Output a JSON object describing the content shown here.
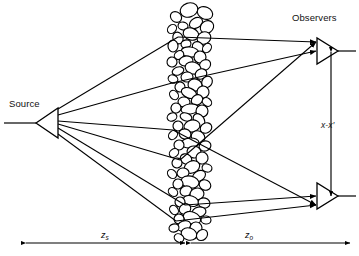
{
  "figure": {
    "type": "optical-scattering-geometry-diagram",
    "background_color": "#ffffff",
    "stroke_color": "#000000"
  },
  "labels": {
    "source": "Source",
    "observers": "Observers",
    "separation": "x-x",
    "separation_prime": "′",
    "distance_source": "z",
    "distance_source_sub": "s",
    "distance_observer": "z",
    "distance_observer_sub": "o"
  },
  "geometry": {
    "source": {
      "apex_x": 36,
      "base_x": 58,
      "y": 123,
      "half_height": 15,
      "tail_x": 4
    },
    "observers": [
      {
        "name": "observer-top",
        "apex_x": 338,
        "base_x": 317,
        "y": 51,
        "half_height": 13,
        "tail_x": 356
      },
      {
        "name": "observer-bottom",
        "apex_x": 338,
        "base_x": 317,
        "y": 196,
        "half_height": 13,
        "tail_x": 356
      }
    ],
    "medium": {
      "center_x": 188,
      "left_x": 167,
      "right_x": 212,
      "top_y": 4,
      "bottom_y": 241,
      "blob_count": 96
    },
    "separation_arrow": {
      "x": 331,
      "y_top": 52,
      "y_bottom": 196
    },
    "dimension_axis_y": 243,
    "z_s_arrow": {
      "x_start": 26,
      "x_end": 185
    },
    "z_o_arrow": {
      "x_start": 191,
      "x_end": 350
    }
  },
  "rays": {
    "count": 6,
    "source_fan_y": [
      109,
      115,
      121,
      124,
      128,
      134
    ],
    "scatter_points": [
      {
        "x": 178,
        "y": 37,
        "to": "observer-top"
      },
      {
        "x": 172,
        "y": 83,
        "to": "observer-top"
      },
      {
        "x": 173,
        "y": 130,
        "to": "observer-bottom"
      },
      {
        "x": 180,
        "y": 160,
        "to": "observer-top"
      },
      {
        "x": 185,
        "y": 205,
        "to": "observer-bottom"
      },
      {
        "x": 176,
        "y": 221,
        "to": "observer-bottom"
      }
    ]
  },
  "blobs": [
    {
      "cx": 189,
      "cy": 10,
      "rx": 9,
      "ry": 7,
      "rot": -18
    },
    {
      "cx": 205,
      "cy": 13,
      "rx": 8,
      "ry": 6,
      "rot": 25
    },
    {
      "cx": 176,
      "cy": 17,
      "rx": 6,
      "ry": 5,
      "rot": 40
    },
    {
      "cx": 196,
      "cy": 23,
      "rx": 7,
      "ry": 5,
      "rot": -30
    },
    {
      "cx": 183,
      "cy": 26,
      "rx": 5,
      "ry": 4,
      "rot": 10
    },
    {
      "cx": 207,
      "cy": 27,
      "rx": 6,
      "ry": 7,
      "rot": 55
    },
    {
      "cx": 172,
      "cy": 29,
      "rx": 5,
      "ry": 4,
      "rot": -45
    },
    {
      "cx": 191,
      "cy": 34,
      "rx": 8,
      "ry": 6,
      "rot": 20
    },
    {
      "cx": 204,
      "cy": 38,
      "rx": 7,
      "ry": 6,
      "rot": -25
    },
    {
      "cx": 178,
      "cy": 38,
      "rx": 6,
      "ry": 5,
      "rot": 65
    },
    {
      "cx": 186,
      "cy": 44,
      "rx": 5,
      "ry": 4,
      "rot": -15
    },
    {
      "cx": 198,
      "cy": 47,
      "rx": 6,
      "ry": 5,
      "rot": 35
    },
    {
      "cx": 173,
      "cy": 46,
      "rx": 5,
      "ry": 6,
      "rot": 0
    },
    {
      "cx": 207,
      "cy": 48,
      "rx": 5,
      "ry": 4,
      "rot": -50
    },
    {
      "cx": 190,
      "cy": 52,
      "rx": 9,
      "ry": 5,
      "rot": 8
    },
    {
      "cx": 179,
      "cy": 55,
      "rx": 5,
      "ry": 4,
      "rot": -35
    },
    {
      "cx": 200,
      "cy": 57,
      "rx": 6,
      "ry": 6,
      "rot": 45
    },
    {
      "cx": 186,
      "cy": 61,
      "rx": 7,
      "ry": 5,
      "rot": -10
    },
    {
      "cx": 172,
      "cy": 62,
      "rx": 5,
      "ry": 5,
      "rot": 30
    },
    {
      "cx": 205,
      "cy": 65,
      "rx": 6,
      "ry": 5,
      "rot": -40
    },
    {
      "cx": 193,
      "cy": 68,
      "rx": 8,
      "ry": 6,
      "rot": 15
    },
    {
      "cx": 178,
      "cy": 71,
      "rx": 6,
      "ry": 4,
      "rot": -20
    },
    {
      "cx": 201,
      "cy": 74,
      "rx": 5,
      "ry": 6,
      "rot": 60
    },
    {
      "cx": 187,
      "cy": 77,
      "rx": 6,
      "ry": 5,
      "rot": -5
    },
    {
      "cx": 173,
      "cy": 79,
      "rx": 5,
      "ry": 4,
      "rot": 25
    },
    {
      "cx": 207,
      "cy": 82,
      "rx": 6,
      "ry": 5,
      "rot": -55
    },
    {
      "cx": 195,
      "cy": 85,
      "rx": 7,
      "ry": 6,
      "rot": 12
    },
    {
      "cx": 180,
      "cy": 87,
      "rx": 5,
      "ry": 5,
      "rot": -30
    },
    {
      "cx": 189,
      "cy": 93,
      "rx": 8,
      "ry": 5,
      "rot": 22
    },
    {
      "cx": 203,
      "cy": 92,
      "rx": 6,
      "ry": 6,
      "rot": -15
    },
    {
      "cx": 174,
      "cy": 95,
      "rx": 5,
      "ry": 4,
      "rot": 50
    },
    {
      "cx": 197,
      "cy": 100,
      "rx": 6,
      "ry": 5,
      "rot": -35
    },
    {
      "cx": 184,
      "cy": 102,
      "rx": 6,
      "ry": 5,
      "rot": 5
    },
    {
      "cx": 207,
      "cy": 102,
      "rx": 5,
      "ry": 4,
      "rot": 40
    },
    {
      "cx": 190,
      "cy": 109,
      "rx": 9,
      "ry": 5,
      "rot": -8
    },
    {
      "cx": 176,
      "cy": 108,
      "rx": 5,
      "ry": 5,
      "rot": 28
    },
    {
      "cx": 202,
      "cy": 111,
      "rx": 6,
      "ry": 6,
      "rot": -45
    },
    {
      "cx": 186,
      "cy": 117,
      "rx": 6,
      "ry": 4,
      "rot": 18
    },
    {
      "cx": 172,
      "cy": 117,
      "rx": 5,
      "ry": 4,
      "rot": -25
    },
    {
      "cx": 199,
      "cy": 120,
      "rx": 7,
      "ry": 5,
      "rot": 52
    },
    {
      "cx": 192,
      "cy": 126,
      "rx": 8,
      "ry": 6,
      "rot": -12
    },
    {
      "cx": 178,
      "cy": 126,
      "rx": 5,
      "ry": 5,
      "rot": 35
    },
    {
      "cx": 206,
      "cy": 128,
      "rx": 6,
      "ry": 5,
      "rot": -30
    },
    {
      "cx": 185,
      "cy": 134,
      "rx": 6,
      "ry": 5,
      "rot": 15
    },
    {
      "cx": 173,
      "cy": 135,
      "rx": 5,
      "ry": 4,
      "rot": -48
    },
    {
      "cx": 198,
      "cy": 137,
      "rx": 7,
      "ry": 6,
      "rot": 25
    },
    {
      "cx": 190,
      "cy": 143,
      "rx": 9,
      "ry": 5,
      "rot": -5
    },
    {
      "cx": 179,
      "cy": 145,
      "rx": 5,
      "ry": 5,
      "rot": 42
    },
    {
      "cx": 205,
      "cy": 146,
      "rx": 6,
      "ry": 5,
      "rot": -20
    },
    {
      "cx": 194,
      "cy": 152,
      "rx": 7,
      "ry": 6,
      "rot": 10
    },
    {
      "cx": 174,
      "cy": 153,
      "rx": 5,
      "ry": 4,
      "rot": -38
    },
    {
      "cx": 186,
      "cy": 159,
      "rx": 6,
      "ry": 5,
      "rot": 30
    },
    {
      "cx": 202,
      "cy": 158,
      "rx": 6,
      "ry": 6,
      "rot": -15
    },
    {
      "cx": 177,
      "cy": 163,
      "rx": 5,
      "ry": 5,
      "rot": 55
    },
    {
      "cx": 192,
      "cy": 167,
      "rx": 8,
      "ry": 6,
      "rot": -22
    },
    {
      "cx": 207,
      "cy": 168,
      "rx": 5,
      "ry": 4,
      "rot": 18
    },
    {
      "cx": 183,
      "cy": 173,
      "rx": 6,
      "ry": 5,
      "rot": -8
    },
    {
      "cx": 172,
      "cy": 174,
      "rx": 5,
      "ry": 4,
      "rot": 45
    },
    {
      "cx": 199,
      "cy": 176,
      "rx": 7,
      "ry": 5,
      "rot": -32
    },
    {
      "cx": 190,
      "cy": 182,
      "rx": 9,
      "ry": 6,
      "rot": 12
    },
    {
      "cx": 178,
      "cy": 184,
      "rx": 5,
      "ry": 5,
      "rot": -50
    },
    {
      "cx": 205,
      "cy": 185,
      "rx": 6,
      "ry": 5,
      "rot": 28
    },
    {
      "cx": 186,
      "cy": 191,
      "rx": 6,
      "ry": 5,
      "rot": -18
    },
    {
      "cx": 173,
      "cy": 192,
      "rx": 5,
      "ry": 4,
      "rot": 38
    },
    {
      "cx": 197,
      "cy": 194,
      "rx": 7,
      "ry": 6,
      "rot": -10
    },
    {
      "cx": 191,
      "cy": 201,
      "rx": 8,
      "ry": 5,
      "rot": 20
    },
    {
      "cx": 180,
      "cy": 202,
      "rx": 5,
      "ry": 5,
      "rot": -40
    },
    {
      "cx": 204,
      "cy": 203,
      "rx": 6,
      "ry": 5,
      "rot": 15
    },
    {
      "cx": 185,
      "cy": 209,
      "rx": 6,
      "ry": 5,
      "rot": -28
    },
    {
      "cx": 174,
      "cy": 210,
      "rx": 5,
      "ry": 4,
      "rot": 52
    },
    {
      "cx": 199,
      "cy": 212,
      "rx": 7,
      "ry": 5,
      "rot": -12
    },
    {
      "cx": 192,
      "cy": 218,
      "rx": 9,
      "ry": 6,
      "rot": 22
    },
    {
      "cx": 179,
      "cy": 219,
      "rx": 5,
      "ry": 5,
      "rot": -35
    },
    {
      "cx": 206,
      "cy": 220,
      "rx": 5,
      "ry": 4,
      "rot": 8
    },
    {
      "cx": 184,
      "cy": 226,
      "rx": 7,
      "ry": 5,
      "rot": -20
    },
    {
      "cx": 196,
      "cy": 228,
      "rx": 6,
      "ry": 6,
      "rot": 40
    },
    {
      "cx": 174,
      "cy": 228,
      "rx": 5,
      "ry": 4,
      "rot": -15
    },
    {
      "cx": 189,
      "cy": 234,
      "rx": 8,
      "ry": 6,
      "rot": 18
    },
    {
      "cx": 202,
      "cy": 235,
      "rx": 6,
      "ry": 5,
      "rot": -42
    },
    {
      "cx": 179,
      "cy": 238,
      "rx": 5,
      "ry": 4,
      "rot": 30
    }
  ]
}
